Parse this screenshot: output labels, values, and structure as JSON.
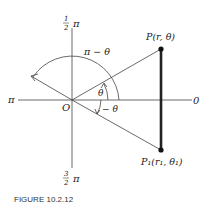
{
  "figure": {
    "caption": "FIGURE 10.2.12",
    "axis_labels": {
      "top_num": "1",
      "top_den": "2",
      "top_pi": "π",
      "left": "π",
      "right": "0",
      "bottom_num": "3",
      "bottom_den": "2",
      "bottom_pi": "π"
    },
    "origin_label": "O",
    "point_p": "P(r, θ)",
    "point_p1": "P₁(r₁, θ₁)",
    "angle_theta": "θ",
    "angle_neg_theta": "− θ",
    "angle_pi_minus_theta": "π − θ"
  }
}
